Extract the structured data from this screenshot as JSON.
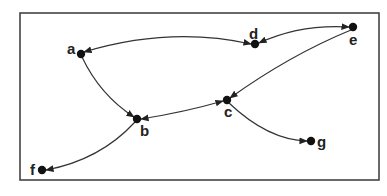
{
  "diagram": {
    "type": "directed-graph",
    "nodes": [
      {
        "id": "a",
        "label": "a",
        "x": 81,
        "y": 54,
        "lx": 67,
        "ly": 54
      },
      {
        "id": "b",
        "label": "b",
        "x": 137,
        "y": 119,
        "lx": 140,
        "ly": 136
      },
      {
        "id": "c",
        "label": "c",
        "x": 227,
        "y": 100,
        "lx": 224,
        "ly": 117
      },
      {
        "id": "d",
        "label": "d",
        "x": 255,
        "y": 44,
        "lx": 249,
        "ly": 39
      },
      {
        "id": "e",
        "label": "e",
        "x": 353,
        "y": 27,
        "lx": 349,
        "ly": 45
      },
      {
        "id": "f",
        "label": "f",
        "x": 42,
        "y": 170,
        "lx": 30,
        "ly": 175
      },
      {
        "id": "g",
        "label": "g",
        "x": 311,
        "y": 141,
        "lx": 317,
        "ly": 147
      }
    ],
    "edges": [
      {
        "from": "a",
        "to": "d",
        "bidirectional": true,
        "path": "M 84 52 Q 170 26 251 44"
      },
      {
        "from": "d",
        "to": "e",
        "bidirectional": true,
        "path": "M 259 43 Q 300 24 349 27"
      },
      {
        "from": "e",
        "to": "c",
        "bidirectional": false,
        "path": "M 351 30 Q 290 55 230 98"
      },
      {
        "from": "a",
        "to": "b",
        "bidirectional": false,
        "path": "M 82 57 Q 100 95 134 117"
      },
      {
        "from": "b",
        "to": "c",
        "bidirectional": true,
        "path": "M 141 119 Q 185 112 223 101"
      },
      {
        "from": "c",
        "to": "g",
        "bidirectional": false,
        "path": "M 229 103 Q 268 140 307 141"
      },
      {
        "from": "b",
        "to": "f",
        "bidirectional": false,
        "path": "M 135 122 Q 100 160 46 170"
      }
    ]
  }
}
